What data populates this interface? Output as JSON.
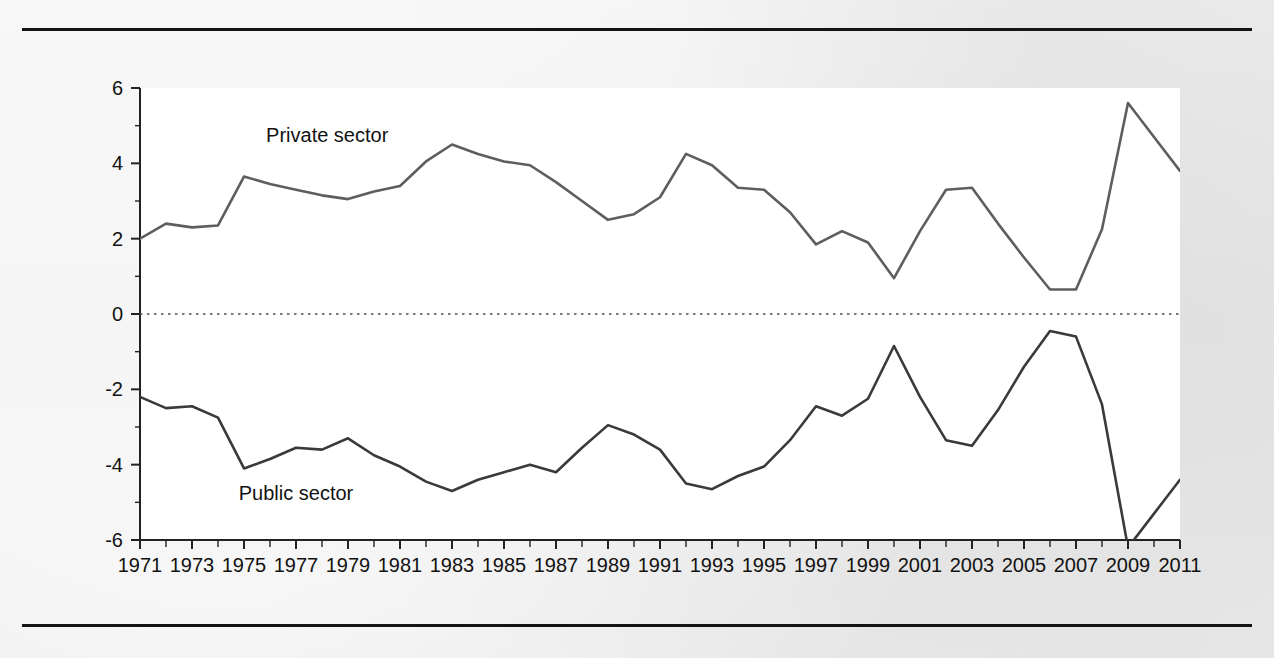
{
  "figure": {
    "background_color": "#ededed",
    "plot_background_color": "#ffffff",
    "rule_color": "#141414",
    "has_top_rule": true,
    "has_bottom_rule": true
  },
  "chart_data": {
    "type": "line",
    "title": "",
    "subtitle": "",
    "xlabel": "",
    "ylabel": "",
    "xlim": [
      1971,
      2011
    ],
    "ylim": [
      -6,
      6
    ],
    "yticks": [
      -6,
      -4,
      -2,
      0,
      2,
      4,
      6
    ],
    "ytick_labels": [
      "-6",
      "-4",
      "-2",
      "0",
      "2",
      "4",
      "6"
    ],
    "ytick_minor_step": 1,
    "xticks": [
      1971,
      1972,
      1973,
      1974,
      1975,
      1976,
      1977,
      1978,
      1979,
      1980,
      1981,
      1982,
      1983,
      1984,
      1985,
      1986,
      1987,
      1988,
      1989,
      1990,
      1991,
      1992,
      1993,
      1994,
      1995,
      1996,
      1997,
      1998,
      1999,
      2000,
      2001,
      2002,
      2003,
      2004,
      2005,
      2006,
      2007,
      2008,
      2009,
      2010,
      2011
    ],
    "xtick_labels": [
      "1971",
      "1973",
      "1975",
      "1977",
      "1979",
      "1981",
      "1983",
      "1985",
      "1987",
      "1989",
      "1991",
      "1993",
      "1995",
      "1997",
      "1999",
      "2001",
      "2003",
      "2005",
      "2007",
      "2009",
      "2011"
    ],
    "xtick_label_years": [
      1971,
      1973,
      1975,
      1977,
      1979,
      1981,
      1983,
      1985,
      1987,
      1989,
      1991,
      1993,
      1995,
      1997,
      1999,
      2001,
      2003,
      2005,
      2007,
      2009,
      2011
    ],
    "grid": false,
    "zero_line": true,
    "zero_line_style": "dotted",
    "zero_line_color": "#4d4d4d",
    "legend": "inline-labels",
    "x": [
      1971,
      1972,
      1973,
      1974,
      1975,
      1976,
      1977,
      1978,
      1979,
      1980,
      1981,
      1982,
      1983,
      1984,
      1985,
      1986,
      1987,
      1988,
      1989,
      1990,
      1991,
      1992,
      1993,
      1994,
      1995,
      1996,
      1997,
      1998,
      1999,
      2000,
      2001,
      2002,
      2003,
      2004,
      2005,
      2006,
      2007,
      2008,
      2009,
      2010,
      2011
    ],
    "series": [
      {
        "name": "Private sector",
        "color": "#5e5e5e",
        "label_x": 1978.2,
        "label_y": 4.75,
        "values": [
          2.0,
          2.4,
          2.3,
          2.35,
          3.65,
          3.45,
          3.3,
          3.15,
          3.05,
          3.25,
          3.4,
          4.05,
          4.5,
          4.25,
          4.05,
          3.95,
          3.5,
          3.0,
          2.5,
          2.65,
          3.1,
          4.25,
          3.95,
          3.35,
          3.3,
          2.7,
          1.85,
          2.2,
          1.9,
          0.95,
          2.2,
          3.3,
          3.35,
          2.4,
          1.5,
          0.65,
          0.65,
          2.25,
          5.6,
          4.7,
          3.8
        ]
      },
      {
        "name": "Public sector",
        "color": "#3a3a3a",
        "label_x": 1977.0,
        "label_y": -4.75,
        "values": [
          -2.2,
          -2.5,
          -2.45,
          -2.75,
          -4.1,
          -3.85,
          -3.55,
          -3.6,
          -3.3,
          -3.75,
          -4.05,
          -4.45,
          -4.7,
          -4.4,
          -4.2,
          -4.0,
          -4.2,
          -3.55,
          -2.95,
          -3.2,
          -3.6,
          -4.5,
          -4.65,
          -4.3,
          -4.05,
          -3.35,
          -2.45,
          -2.7,
          -2.25,
          -0.85,
          -2.2,
          -3.35,
          -3.5,
          -2.55,
          -1.4,
          -0.45,
          -0.6,
          -2.4,
          -6.2,
          -5.3,
          -4.4
        ]
      }
    ],
    "annotations": [
      {
        "text": "Private sector",
        "x": 1978.2,
        "y": 4.75
      },
      {
        "text": "Public sector",
        "x": 1977.0,
        "y": -4.75
      }
    ]
  }
}
